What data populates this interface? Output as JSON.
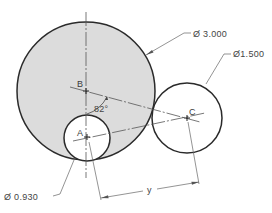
{
  "diagram": {
    "type": "engineering-drawing",
    "colors": {
      "background": "#ffffff",
      "shaded_fill": "#dcdcdc",
      "outline": "#2a2a2a",
      "center_line": "#555555",
      "text": "#3a3a3a"
    },
    "points": {
      "A": {
        "label": "A",
        "x": 87,
        "y": 137
      },
      "B": {
        "label": "B",
        "x": 86,
        "y": 91
      },
      "C": {
        "label": "C",
        "x": 187,
        "y": 118
      }
    },
    "circles": [
      {
        "id": "large",
        "center": "B",
        "r": 69,
        "diameter_label": "Ø 3.000",
        "shaded": true
      },
      {
        "id": "medium",
        "center": "C",
        "r": 35,
        "diameter_label": "Ø1.500",
        "shaded": false
      },
      {
        "id": "small",
        "center": "A",
        "r": 23,
        "diameter_label": "Ø 0.930",
        "shaded": false
      }
    ],
    "angle": {
      "label": "82°",
      "vertex": "B"
    },
    "dimension": {
      "label": "y",
      "from": "A",
      "to": "C"
    }
  }
}
